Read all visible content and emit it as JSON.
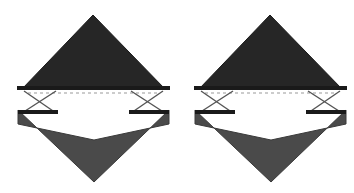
{
  "document": {
    "title": "Paired truss diagram",
    "background_color": "#ffffff",
    "width": 354,
    "height": 193
  },
  "palette": {
    "background": "#ffffff",
    "top_triangle_fill": "#262626",
    "top_triangle_stroke": "#1a1a1a",
    "bottom_chevron_fill": "#4a4a4a",
    "bottom_chevron_stroke": "#3a3a3a",
    "chord_bar": "#1a1a1a",
    "strut_stroke": "#555555",
    "dashed_line": "#9a9a9a",
    "void_fill": "#ffffff"
  },
  "figures": [
    {
      "id": "figure-left",
      "name": "left-truss-figure",
      "offset_x": 0,
      "top_triangle": {
        "name": "upper-dark-triangle",
        "apex": [
          93,
          15
        ],
        "base_left": [
          22,
          89
        ],
        "base_right": [
          165,
          89
        ],
        "fill": "#262626"
      },
      "top_chord_bar": {
        "name": "upper-chord-bar",
        "left": [
          17,
          88
        ],
        "right": [
          170,
          88
        ],
        "thickness": 4,
        "fill": "#1a1a1a"
      },
      "dashed_line": {
        "name": "reference-dashed-line",
        "y": 93,
        "x_start": 28,
        "x_end": 160,
        "dash": "3 3",
        "color": "#9a9a9a"
      },
      "lower_chord_bars": [
        {
          "name": "lower-chord-bar-left",
          "left": [
            18,
            112
          ],
          "right": [
            58,
            112
          ],
          "thickness": 4
        },
        {
          "name": "lower-chord-bar-right",
          "left": [
            129,
            112
          ],
          "right": [
            169,
            112
          ],
          "thickness": 4
        }
      ],
      "struts": [
        {
          "name": "strut-left-outer",
          "from": [
            24,
            91
          ],
          "to": [
            56,
            113
          ]
        },
        {
          "name": "strut-left-inner",
          "from": [
            56,
            91
          ],
          "to": [
            22,
            113
          ]
        },
        {
          "name": "strut-right-outer",
          "from": [
            163,
            91
          ],
          "to": [
            131,
            113
          ]
        },
        {
          "name": "strut-right-inner",
          "from": [
            131,
            91
          ],
          "to": [
            165,
            113
          ]
        }
      ],
      "bottom_chevron": {
        "name": "lower-gray-chevron",
        "points": "18,110 94,182 169,110 169,124 94,140 18,124",
        "fill": "#4a4a4a"
      }
    },
    {
      "id": "figure-right",
      "name": "right-truss-figure",
      "offset_x": 177,
      "top_triangle": {
        "name": "upper-dark-triangle",
        "apex": [
          93,
          15
        ],
        "base_left": [
          22,
          89
        ],
        "base_right": [
          165,
          89
        ],
        "fill": "#262626"
      },
      "top_chord_bar": {
        "name": "upper-chord-bar",
        "left": [
          17,
          88
        ],
        "right": [
          170,
          88
        ],
        "thickness": 4,
        "fill": "#1a1a1a"
      },
      "dashed_line": {
        "name": "reference-dashed-line",
        "y": 93,
        "x_start": 28,
        "x_end": 160,
        "dash": "3 3",
        "color": "#9a9a9a"
      },
      "lower_chord_bars": [
        {
          "name": "lower-chord-bar-left",
          "left": [
            18,
            112
          ],
          "right": [
            58,
            112
          ],
          "thickness": 4
        },
        {
          "name": "lower-chord-bar-right",
          "left": [
            129,
            112
          ],
          "right": [
            169,
            112
          ],
          "thickness": 4
        }
      ],
      "struts": [
        {
          "name": "strut-left-outer",
          "from": [
            24,
            91
          ],
          "to": [
            56,
            113
          ]
        },
        {
          "name": "strut-left-inner",
          "from": [
            56,
            91
          ],
          "to": [
            22,
            113
          ]
        },
        {
          "name": "strut-right-outer",
          "from": [
            163,
            91
          ],
          "to": [
            131,
            113
          ]
        },
        {
          "name": "strut-right-inner",
          "from": [
            131,
            91
          ],
          "to": [
            165,
            113
          ]
        }
      ],
      "bottom_chevron": {
        "name": "lower-gray-chevron",
        "points": "18,110 94,182 169,110 169,124 94,140 18,124",
        "fill": "#4a4a4a"
      }
    }
  ]
}
